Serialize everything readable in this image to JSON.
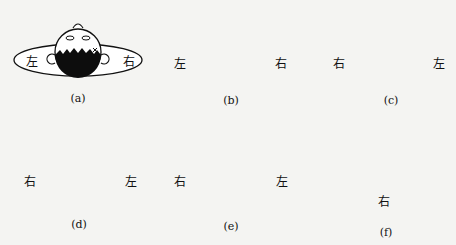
{
  "figure": {
    "panels": [
      {
        "id": "a",
        "caption": "(a)",
        "left_label": "左",
        "right_label": "右",
        "view": "patient upright, head facing up (top view), crown up",
        "arrow": "none"
      },
      {
        "id": "b",
        "caption": "(b)",
        "left_label": "左",
        "right_label": "右",
        "view": "head turned, face toward left",
        "arrow": "counter-clockwise arc over top"
      },
      {
        "id": "c",
        "caption": "(c)",
        "left_label": "右",
        "right_label": "左",
        "view": "lying, face toward left",
        "arrow": "large arc from right to left over top"
      },
      {
        "id": "d",
        "caption": "(d)",
        "left_label": "右",
        "right_label": "左",
        "view": "face down",
        "arrow": "arc from left down to bottom"
      },
      {
        "id": "e",
        "caption": "(e)",
        "left_label": "右",
        "right_label": "左",
        "view": "face toward right",
        "arrow": "arc from right down to bottom"
      },
      {
        "id": "f",
        "caption": "(f)",
        "side_label": "右",
        "view": "side profile sitting up"
      }
    ],
    "colors": {
      "ink": "#111111",
      "paper": "#f4f4f2",
      "hair": "#0d0d0d"
    }
  }
}
